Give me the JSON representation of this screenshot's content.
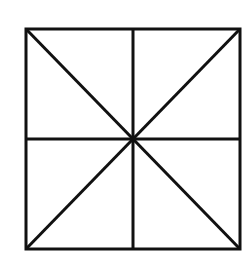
{
  "diagram": {
    "stroke_color": "#111111",
    "background_color": "#ffffff",
    "stroke_width": 3,
    "square": {
      "x1": 26,
      "y1": 29,
      "x2": 240,
      "y2": 249
    },
    "center": {
      "x": 133,
      "y": 139
    },
    "lines": [
      {
        "name": "diagonal-top-left-to-bottom-right",
        "x1": 26,
        "y1": 29,
        "x2": 240,
        "y2": 249
      },
      {
        "name": "diagonal-top-right-to-bottom-left",
        "x1": 240,
        "y1": 29,
        "x2": 26,
        "y2": 249
      },
      {
        "name": "vertical-midline",
        "x1": 133,
        "y1": 29,
        "x2": 133,
        "y2": 249
      },
      {
        "name": "horizontal-midline",
        "x1": 26,
        "y1": 139,
        "x2": 240,
        "y2": 139
      }
    ]
  }
}
